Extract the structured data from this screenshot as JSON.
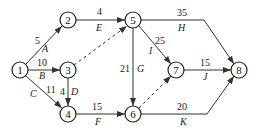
{
  "diagram": {
    "type": "activity-on-arrow network",
    "nodes": [
      {
        "id": "1",
        "label": "1",
        "x": 20,
        "y": 70
      },
      {
        "id": "2",
        "label": "2",
        "x": 68,
        "y": 20
      },
      {
        "id": "3",
        "label": "3",
        "x": 68,
        "y": 70
      },
      {
        "id": "4",
        "label": "4",
        "x": 68,
        "y": 114
      },
      {
        "id": "5",
        "label": "5",
        "x": 133,
        "y": 20
      },
      {
        "id": "6",
        "label": "6",
        "x": 133,
        "y": 114
      },
      {
        "id": "7",
        "label": "7",
        "x": 176,
        "y": 70
      },
      {
        "id": "8",
        "label": "8",
        "x": 239,
        "y": 70
      }
    ],
    "edges": [
      {
        "from": "1",
        "to": "2",
        "duration": "5",
        "activity": "A",
        "dashed": false
      },
      {
        "from": "1",
        "to": "3",
        "duration": "10",
        "activity": "B",
        "dashed": false
      },
      {
        "from": "1",
        "to": "4",
        "duration": "11",
        "activity": "C",
        "dashed": false
      },
      {
        "from": "3",
        "to": "4",
        "duration": "4",
        "activity": "D",
        "dashed": false
      },
      {
        "from": "2",
        "to": "5",
        "duration": "4",
        "activity": "E",
        "dashed": false
      },
      {
        "from": "3",
        "to": "5",
        "duration": "",
        "activity": "",
        "dashed": true
      },
      {
        "from": "4",
        "to": "6",
        "duration": "15",
        "activity": "F",
        "dashed": false
      },
      {
        "from": "5",
        "to": "6",
        "duration": "21",
        "activity": "G",
        "dashed": false
      },
      {
        "from": "5",
        "to": "8",
        "duration": "35",
        "activity": "H",
        "dashed": false
      },
      {
        "from": "5",
        "to": "7",
        "duration": "25",
        "activity": "I",
        "dashed": false
      },
      {
        "from": "6",
        "to": "7",
        "duration": "",
        "activity": "",
        "dashed": true
      },
      {
        "from": "7",
        "to": "8",
        "duration": "15",
        "activity": "J",
        "dashed": false
      },
      {
        "from": "6",
        "to": "8",
        "duration": "20",
        "activity": "K",
        "dashed": false
      }
    ]
  }
}
